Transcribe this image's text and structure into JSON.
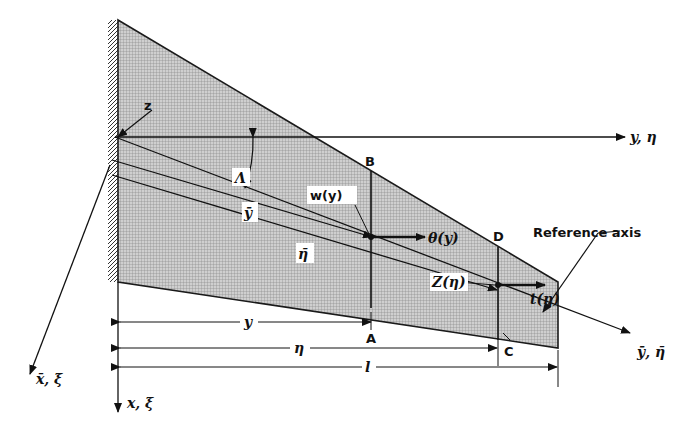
{
  "diagram": {
    "type": "swept cantilever wing geometry",
    "colors": {
      "wing_fill": "#bdbdbd",
      "line": "#1a1a1a",
      "background": "#ffffff"
    },
    "labels": {
      "z": "z",
      "y_eta": "y, η",
      "lambda": "Λ",
      "B": "B",
      "A": "A",
      "D": "D",
      "C": "C",
      "w_y": "w(y)",
      "theta_y": "θ(y)",
      "y_bar": "ȳ",
      "eta_bar": "η̄",
      "Z_eta": "Z(η)",
      "t_eta": "t(η)",
      "reference_axis": "Reference axis",
      "ybar_etabar": "ȳ, η̄",
      "xbar_xibar": "x̄, ξ̄",
      "x_xi": "x, ξ"
    },
    "dimensions": {
      "y": "y",
      "eta": "η",
      "l": "l"
    }
  }
}
